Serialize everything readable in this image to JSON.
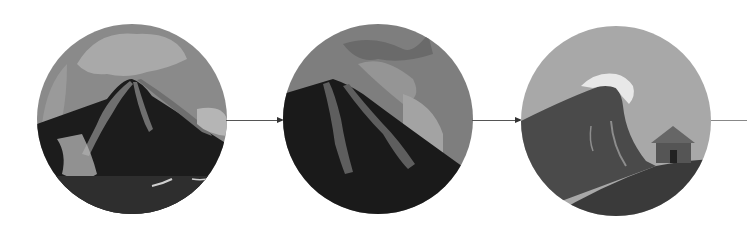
{
  "diagram": {
    "type": "sequence",
    "panels": [
      {
        "id": "eruption",
        "label": "Volcanic eruption",
        "colors": {
          "sky": "#8a8a8a",
          "plume": "#a9a9a9",
          "mountain": "#1c1c1c",
          "lava": "#6f6f6f",
          "sea": "#2e2e2e"
        }
      },
      {
        "id": "flank-collapse",
        "label": "Flank collapse into sea",
        "colors": {
          "sky": "#7e7e7e",
          "plume": "#959595",
          "mountain": "#1a1a1a",
          "lava": "#5e5e5e"
        }
      },
      {
        "id": "tsunami",
        "label": "Tsunami reaching coast",
        "colors": {
          "sky": "#a8a8a8",
          "wave": "#4a4a4a",
          "foam": "#e8e8e8",
          "ground": "#3a3a3a",
          "house": "#555555"
        }
      }
    ],
    "arrows": [
      {
        "from": "eruption",
        "to": "flank-collapse"
      },
      {
        "from": "flank-collapse",
        "to": "tsunami"
      },
      {
        "from": "tsunami",
        "to": "next"
      }
    ]
  }
}
